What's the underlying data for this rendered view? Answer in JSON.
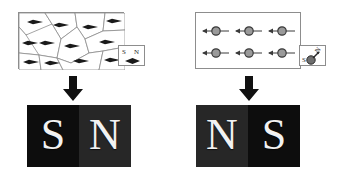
{
  "figure": {
    "background_color": "#ffffff",
    "outline_color": "#8d8d8d",
    "domain_fill": "#ffffff",
    "dipole_color": "#1a1a1a",
    "arrow_color": "#111111"
  },
  "panels": [
    {
      "id": "left-panel",
      "name": "unmagnetized-random-domains",
      "sample_box": {
        "x": 18,
        "y": 12,
        "width": 106,
        "height": 57,
        "domain_count": 12,
        "dipole_shape": "lens-diamond"
      },
      "key_box": {
        "x": 118,
        "y": 45,
        "width": 27,
        "height": 21,
        "letters": [
          {
            "text": "S",
            "x": 3,
            "y": 3,
            "size": 7,
            "rotate": 0
          },
          {
            "text": "N",
            "x": 15,
            "y": 3,
            "size": 7,
            "rotate": 0
          }
        ],
        "magnet_orientation": "horizontal"
      },
      "arrow": {
        "x": 62,
        "y": 76,
        "width": 22,
        "height": 26,
        "direction": "down"
      },
      "bar_magnet": {
        "x": 27,
        "y": 105,
        "width": 104,
        "height": 62,
        "left_pole": {
          "label": "S",
          "color": "#0d0d0d"
        },
        "right_pole": {
          "label": "N",
          "color": "#272727"
        }
      }
    },
    {
      "id": "right-panel",
      "name": "magnetized-aligned-dipoles",
      "sample_box": {
        "x": 195,
        "y": 12,
        "width": 106,
        "height": 57,
        "dipole_rows": 2,
        "dipole_cols": 3,
        "dipole_shape": "circle-with-left-arrow",
        "dipole_direction": "left"
      },
      "key_box": {
        "x": 299,
        "y": 45,
        "width": 27,
        "height": 21,
        "letters": [
          {
            "text": "S",
            "x": 2,
            "y": 11,
            "size": 7,
            "rotate": 0
          },
          {
            "text": "N",
            "x": 16,
            "y": 1,
            "size": 7,
            "rotate": -55
          }
        ],
        "magnet_orientation": "diagonal"
      },
      "arrow": {
        "x": 238,
        "y": 76,
        "width": 22,
        "height": 26,
        "direction": "down"
      },
      "bar_magnet": {
        "x": 196,
        "y": 105,
        "width": 104,
        "height": 62,
        "left_pole": {
          "label": "N",
          "color": "#272727"
        },
        "right_pole": {
          "label": "S",
          "color": "#0d0d0d"
        }
      }
    }
  ],
  "domain_polygons": [
    "M0,0 L26,0 L33,11 L22,24 L7,22 L0,14 Z",
    "M26,0 L56,0 L58,14 L42,26 L33,11 Z",
    "M56,0 L86,0 L84,18 L66,26 L58,14 Z",
    "M86,0 L106,0 L106,17 L84,18 Z",
    "M0,14 L7,22 L22,24 L20,42 L0,40 Z",
    "M7,22 L33,11 L42,26 L38,45 L20,42 Z",
    "M42,26 L58,14 L66,26 L70,40 L52,50 L38,45 Z",
    "M66,26 L84,18 L106,17 L106,34 L84,38 L70,40 Z",
    "M0,40 L20,42 L22,57 L0,57 Z",
    "M20,42 L38,45 L44,57 L22,57 Z",
    "M38,45 L52,50 L70,40 L84,38 L80,57 L44,57 Z",
    "M84,38 L106,34 L106,57 L80,57 Z"
  ],
  "domain_dipoles": [
    {
      "cx": 16,
      "cy": 9
    },
    {
      "cx": 42,
      "cy": 12
    },
    {
      "cx": 71,
      "cy": 14
    },
    {
      "cx": 95,
      "cy": 8
    },
    {
      "cx": 11,
      "cy": 30
    },
    {
      "cx": 28,
      "cy": 30
    },
    {
      "cx": 53,
      "cy": 33
    },
    {
      "cx": 88,
      "cy": 29
    },
    {
      "cx": 12,
      "cy": 49
    },
    {
      "cx": 33,
      "cy": 50
    },
    {
      "cx": 62,
      "cy": 48
    },
    {
      "cx": 93,
      "cy": 47
    }
  ],
  "aligned_dipoles": [
    {
      "cx": 20,
      "cy": 18
    },
    {
      "cx": 53,
      "cy": 18
    },
    {
      "cx": 86,
      "cy": 18
    },
    {
      "cx": 20,
      "cy": 40
    },
    {
      "cx": 53,
      "cy": 40
    },
    {
      "cx": 86,
      "cy": 40
    }
  ]
}
